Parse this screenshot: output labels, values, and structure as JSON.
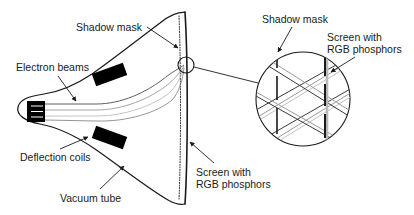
{
  "figure": {
    "background_color": "#ffffff",
    "line_color": "#1a1a1a",
    "beam_color": "#999999",
    "fill_black": "#000000",
    "width": 414,
    "height": 215
  },
  "labels": {
    "shadow_mask_left": "Shadow mask",
    "electron_beams": "Electron beams",
    "deflection_coils": "Deflection coils",
    "vacuum_tube": "Vacuum tube",
    "screen_rgb_center_line1": "Screen with",
    "screen_rgb_center_line2": "RGB phosphors",
    "shadow_mask_detail": "Shadow mask",
    "screen_rgb_detail_line1": "Screen with",
    "screen_rgb_detail_line2": "RGB phosphors"
  },
  "parts": {
    "electron_gun": "electron-gun",
    "deflection_coil_upper": "deflection-coil-upper",
    "deflection_coil_lower": "deflection-coil-lower",
    "shadow_mask_line": "shadow-mask-dotted-line",
    "screen_face": "screen-face",
    "callout_circle": "callout-circle-small",
    "detail_circle": "detail-circle-magnified",
    "beam_count": 3
  }
}
